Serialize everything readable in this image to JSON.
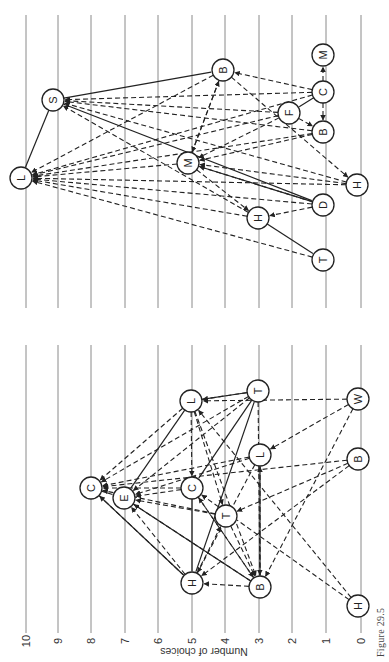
{
  "figure": {
    "caption": "Figure 29.5",
    "axis_label": "Number of choices",
    "ticks": [
      "0",
      "1",
      "2",
      "3",
      "4",
      "5",
      "6",
      "7",
      "8",
      "9",
      "10"
    ]
  },
  "grid": {
    "x_positions": [
      361,
      326,
      292,
      259,
      225,
      192,
      158,
      125,
      91,
      58,
      26
    ],
    "top_panel": {
      "y1": 15,
      "y2": 308
    },
    "bottom_panel": {
      "y1": 345,
      "y2": 633
    }
  },
  "panels": [
    {
      "name": "group-right",
      "nodes": [
        {
          "id": "L1",
          "label": "L",
          "x": 21,
          "y": 178
        },
        {
          "id": "S1",
          "label": "S",
          "x": 53,
          "y": 100
        },
        {
          "id": "B1",
          "label": "B",
          "x": 223,
          "y": 70
        },
        {
          "id": "M1",
          "label": "M",
          "x": 323,
          "y": 55
        },
        {
          "id": "C1",
          "label": "C",
          "x": 323,
          "y": 92
        },
        {
          "id": "F1",
          "label": "F",
          "x": 289,
          "y": 113
        },
        {
          "id": "B2",
          "label": "B",
          "x": 323,
          "y": 132
        },
        {
          "id": "M2",
          "label": "M",
          "x": 188,
          "y": 163
        },
        {
          "id": "H1",
          "label": "H",
          "x": 357,
          "y": 185
        },
        {
          "id": "D1",
          "label": "D",
          "x": 323,
          "y": 205
        },
        {
          "id": "H2",
          "label": "H",
          "x": 258,
          "y": 218
        },
        {
          "id": "T1",
          "label": "T",
          "x": 323,
          "y": 260
        }
      ],
      "edges": [
        {
          "from": "S1",
          "to": "L1",
          "type": "solid"
        },
        {
          "from": "S1",
          "to": "B1",
          "type": "solid"
        },
        {
          "from": "S1",
          "to": "D1",
          "type": "solid"
        },
        {
          "from": "M2",
          "to": "D1",
          "type": "solid"
        },
        {
          "from": "H2",
          "to": "T1",
          "type": "solid"
        },
        {
          "from": "C1",
          "to": "F1",
          "type": "solid"
        },
        {
          "from": "C1",
          "to": "M1",
          "type": "dashed"
        },
        {
          "from": "C1",
          "to": "B2",
          "type": "dashed"
        },
        {
          "from": "C1",
          "to": "B1",
          "type": "dashed"
        },
        {
          "from": "C1",
          "to": "S1",
          "type": "dashed"
        },
        {
          "from": "C1",
          "to": "L1",
          "type": "dashed"
        },
        {
          "from": "F1",
          "to": "S1",
          "type": "dashed"
        },
        {
          "from": "F1",
          "to": "L1",
          "type": "dashed"
        },
        {
          "from": "F1",
          "to": "B2",
          "type": "dashed"
        },
        {
          "from": "F1",
          "to": "M2",
          "type": "dashed"
        },
        {
          "from": "B2",
          "to": "S1",
          "type": "dashed"
        },
        {
          "from": "B2",
          "to": "L1",
          "type": "dashed"
        },
        {
          "from": "B2",
          "to": "M2",
          "type": "dashed"
        },
        {
          "from": "B1",
          "to": "L1",
          "type": "dashed"
        },
        {
          "from": "B1",
          "to": "M2",
          "type": "dashed"
        },
        {
          "from": "B1",
          "to": "H1",
          "type": "dashed"
        },
        {
          "from": "M2",
          "to": "L1",
          "type": "dashed"
        },
        {
          "from": "M2",
          "to": "B1",
          "type": "dashed"
        },
        {
          "from": "M2",
          "to": "H2",
          "type": "dashed"
        },
        {
          "from": "H1",
          "to": "S1",
          "type": "dashed"
        },
        {
          "from": "H1",
          "to": "L1",
          "type": "dashed"
        },
        {
          "from": "H1",
          "to": "M2",
          "type": "dashed"
        },
        {
          "from": "D1",
          "to": "L1",
          "type": "dashed"
        },
        {
          "from": "D1",
          "to": "M2",
          "type": "dashed"
        },
        {
          "from": "D1",
          "to": "H2",
          "type": "dashed"
        },
        {
          "from": "H2",
          "to": "L1",
          "type": "dashed"
        },
        {
          "from": "H2",
          "to": "S1",
          "type": "dashed"
        },
        {
          "from": "T1",
          "to": "L1",
          "type": "dashed"
        }
      ]
    },
    {
      "name": "group-left",
      "nodes": [
        {
          "id": "L2",
          "label": "L",
          "x": 191,
          "y": 401
        },
        {
          "id": "T2",
          "label": "T",
          "x": 258,
          "y": 391
        },
        {
          "id": "W1",
          "label": "W",
          "x": 358,
          "y": 399
        },
        {
          "id": "L3",
          "label": "L",
          "x": 260,
          "y": 455
        },
        {
          "id": "B3",
          "label": "B",
          "x": 358,
          "y": 459
        },
        {
          "id": "C2",
          "label": "C",
          "x": 91,
          "y": 488
        },
        {
          "id": "E1",
          "label": "E",
          "x": 124,
          "y": 498
        },
        {
          "id": "C3",
          "label": "C",
          "x": 192,
          "y": 488
        },
        {
          "id": "T3",
          "label": "T",
          "x": 226,
          "y": 516
        },
        {
          "id": "H3",
          "label": "H",
          "x": 192,
          "y": 583
        },
        {
          "id": "B4",
          "label": "B",
          "x": 260,
          "y": 587
        },
        {
          "id": "H4",
          "label": "H",
          "x": 358,
          "y": 606
        }
      ],
      "edges": [
        {
          "from": "L2",
          "to": "T2",
          "type": "solid"
        },
        {
          "from": "L2",
          "to": "E1",
          "type": "solid"
        },
        {
          "from": "C2",
          "to": "H3",
          "type": "solid"
        },
        {
          "from": "C2",
          "to": "E1",
          "type": "solid"
        },
        {
          "from": "E1",
          "to": "B4",
          "type": "solid"
        },
        {
          "from": "C3",
          "to": "H3",
          "type": "solid"
        },
        {
          "from": "T2",
          "to": "H3",
          "type": "solid"
        },
        {
          "from": "T2",
          "to": "C3",
          "type": "solid"
        },
        {
          "from": "L3",
          "to": "B4",
          "type": "solid"
        },
        {
          "from": "W1",
          "to": "L2",
          "type": "dashed"
        },
        {
          "from": "W1",
          "to": "L3",
          "type": "dashed"
        },
        {
          "from": "W1",
          "to": "B4",
          "type": "dashed"
        },
        {
          "from": "B3",
          "to": "C2",
          "type": "dashed"
        },
        {
          "from": "B3",
          "to": "T3",
          "type": "dashed"
        },
        {
          "from": "B3",
          "to": "H3",
          "type": "dashed"
        },
        {
          "from": "H4",
          "to": "L2",
          "type": "dashed"
        },
        {
          "from": "H4",
          "to": "C3",
          "type": "dashed"
        },
        {
          "from": "L2",
          "to": "C2",
          "type": "dashed"
        },
        {
          "from": "L2",
          "to": "C3",
          "type": "dashed"
        },
        {
          "from": "L2",
          "to": "T3",
          "type": "dashed"
        },
        {
          "from": "L2",
          "to": "B4",
          "type": "dashed"
        },
        {
          "from": "T2",
          "to": "L2",
          "type": "dashed"
        },
        {
          "from": "T2",
          "to": "C2",
          "type": "dashed"
        },
        {
          "from": "T2",
          "to": "E1",
          "type": "dashed"
        },
        {
          "from": "T2",
          "to": "B4",
          "type": "dashed"
        },
        {
          "from": "L3",
          "to": "C2",
          "type": "dashed"
        },
        {
          "from": "L3",
          "to": "E1",
          "type": "dashed"
        },
        {
          "from": "L3",
          "to": "H3",
          "type": "dashed"
        },
        {
          "from": "C3",
          "to": "C2",
          "type": "dashed"
        },
        {
          "from": "C3",
          "to": "E1",
          "type": "dashed"
        },
        {
          "from": "C3",
          "to": "B4",
          "type": "dashed"
        },
        {
          "from": "T3",
          "to": "C2",
          "type": "dashed"
        },
        {
          "from": "T3",
          "to": "E1",
          "type": "dashed"
        },
        {
          "from": "T3",
          "to": "B4",
          "type": "dashed"
        },
        {
          "from": "H3",
          "to": "C2",
          "type": "dashed"
        },
        {
          "from": "H3",
          "to": "E1",
          "type": "dashed"
        },
        {
          "from": "H3",
          "to": "T3",
          "type": "dashed"
        },
        {
          "from": "B4",
          "to": "H3",
          "type": "dashed"
        },
        {
          "from": "B4",
          "to": "E1",
          "type": "dashed"
        },
        {
          "from": "B4",
          "to": "C3",
          "type": "dashed"
        },
        {
          "from": "B4",
          "to": "L3",
          "type": "dashed"
        }
      ]
    }
  ]
}
